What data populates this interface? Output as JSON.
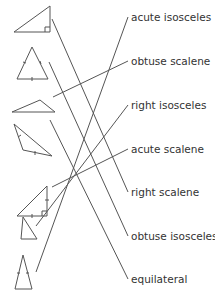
{
  "colors": {
    "stroke": "#555555",
    "text": "#333333",
    "background": "#ffffff"
  },
  "labels": [
    {
      "text": "acute isosceles",
      "y": 11
    },
    {
      "text": "obtuse scalene",
      "y": 55
    },
    {
      "text": "right isosceles",
      "y": 99
    },
    {
      "text": "acute scalene",
      "y": 143
    },
    {
      "text": "right scalene",
      "y": 186
    },
    {
      "text": "obtuse isosceles",
      "y": 230
    },
    {
      "text": "equilateral",
      "y": 273
    }
  ],
  "triangles": [
    {
      "name": "right-scalene-triangle",
      "points": "14,32 50,6 50,32"
    },
    {
      "name": "isosceles-acute-triangle",
      "points": "17,79 32,47 48,79"
    },
    {
      "name": "obtuse-scalene-triangle",
      "points": "12,112 40,100 55,112"
    },
    {
      "name": "obtuse-isosceles-triangle",
      "points": "14,124 23,150 52,156"
    },
    {
      "name": "right-isosceles-triangle",
      "points": "17,216 47,186 47,216"
    },
    {
      "name": "acute-scalene-triangle",
      "points": "21,239 23,217 37,239"
    },
    {
      "name": "equilateral-triangle",
      "points": "15,289 23,255 32,289"
    }
  ],
  "connections": [
    {
      "from": "right-scalene-triangle",
      "to": "right scalene",
      "x1": 52,
      "y1": 19,
      "x2": 128,
      "y2": 192
    },
    {
      "from": "isosceles-acute-triangle",
      "to": "obtuse isosceles",
      "x1": 49,
      "y1": 62,
      "x2": 128,
      "y2": 236
    },
    {
      "from": "obtuse-scalene-triangle",
      "to": "obtuse scalene",
      "x1": 53,
      "y1": 97,
      "x2": 128,
      "y2": 61
    },
    {
      "from": "obtuse-isosceles-triangle",
      "to": "equilateral",
      "x1": 50,
      "y1": 120,
      "x2": 128,
      "y2": 279
    },
    {
      "from": "right-isosceles-triangle",
      "to": "acute scalene",
      "x1": 52,
      "y1": 187,
      "x2": 128,
      "y2": 149
    },
    {
      "from": "acute-scalene-triangle",
      "to": "right isosceles",
      "x1": 36,
      "y1": 226,
      "x2": 128,
      "y2": 105
    },
    {
      "from": "equilateral-triangle",
      "to": "acute isosceles",
      "x1": 36,
      "y1": 272,
      "x2": 128,
      "y2": 17
    }
  ]
}
